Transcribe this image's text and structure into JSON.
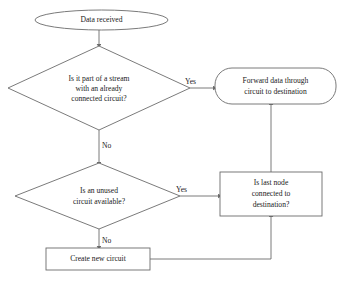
{
  "diagram": {
    "background_color": "#ffffff",
    "stroke_color": "#6b6b6b",
    "text_color": "#1a1a1a",
    "nodes": {
      "start": {
        "shape": "ellipse",
        "label": "Data received"
      },
      "decision_stream": {
        "shape": "diamond",
        "line1": "Is it part of a stream",
        "line2": "with an already",
        "line3": "connected circuit?"
      },
      "forward_data": {
        "shape": "rounded-rectangle",
        "line1": "Forward data through",
        "line2": "circuit to destination"
      },
      "decision_unused": {
        "shape": "diamond",
        "line1": "Is an unused",
        "line2": "circuit available?"
      },
      "last_node": {
        "shape": "rectangle",
        "line1": "Is last node",
        "line2": "connected to",
        "line3": "destination?"
      },
      "create_circuit": {
        "shape": "rectangle",
        "label": "Create new circuit"
      }
    },
    "edge_labels": {
      "stream_yes": "Yes",
      "stream_no": "No",
      "unused_yes": "Yes",
      "unused_no": "No"
    }
  }
}
